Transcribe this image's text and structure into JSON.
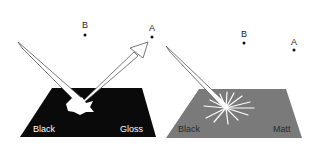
{
  "panels": [
    {
      "name": "gloss",
      "surface_label_left": "Black",
      "surface_label_right": "Gloss",
      "surface_color": "#0a0a0a",
      "point_a": "A",
      "point_b": "B"
    },
    {
      "name": "matt",
      "surface_label_left": "Black",
      "surface_label_right": "Matt",
      "surface_color": "#7a7a7a",
      "point_a": "A",
      "point_b": "B"
    }
  ]
}
